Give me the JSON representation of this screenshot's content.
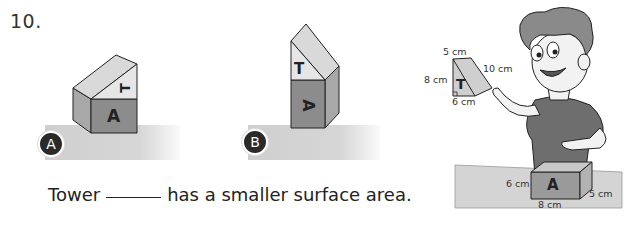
{
  "question": {
    "number": "10.",
    "sentence_before": "Tower",
    "sentence_after": "has a smaller surface area."
  },
  "towers": [
    {
      "id": "A",
      "badge_label": "A",
      "top_label": "T",
      "bottom_label": "A",
      "orientation": "triangle prism lying on side on top of cuboid"
    },
    {
      "id": "B",
      "badge_label": "B",
      "top_label": "T",
      "bottom_label": "A",
      "orientation": "triangle prism standing on top of cuboid"
    }
  ],
  "illustration": {
    "prism_T": {
      "label": "T",
      "measurements": {
        "top": "5 cm",
        "left": "8 cm",
        "bottom": "6 cm",
        "hypotenuse": "10 cm"
      }
    },
    "cuboid_A": {
      "label": "A",
      "measurements": {
        "height": "6 cm",
        "length": "8 cm",
        "depth": "5 cm"
      }
    }
  },
  "colors": {
    "light_face": "#d9d9d9",
    "mid_face": "#a8a8a8",
    "dark_face": "#8c8c8c",
    "ground": "#cfcfcf",
    "badge": "#2a2a2a"
  }
}
